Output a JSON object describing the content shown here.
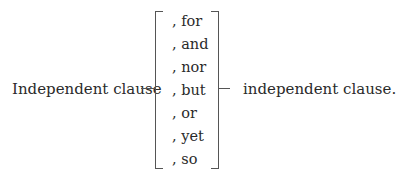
{
  "diagram": {
    "left_clause": "Independent clause",
    "right_clause": "independent clause.",
    "conjunctions": [
      ", for",
      ", and",
      ", nor",
      ", but",
      ", or",
      ", yet",
      ", so"
    ]
  }
}
